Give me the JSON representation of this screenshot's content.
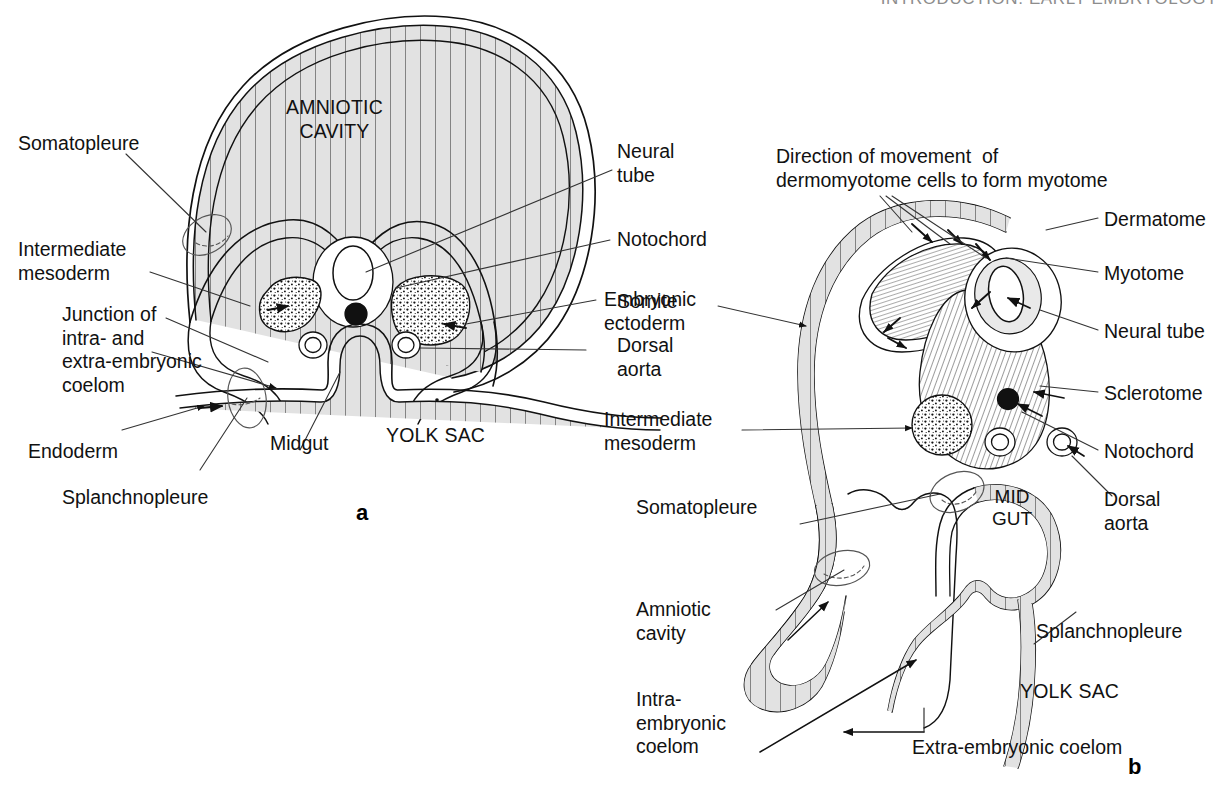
{
  "running_head": "INTRODUCTION: EARLY EMBRYOLOGY",
  "figure": {
    "type": "anatomical-diagram",
    "panels": [
      {
        "id": "a",
        "letter": "a",
        "caption_letter": "a",
        "internal_labels": [
          {
            "name": "amniotic-cavity",
            "text": "AMNIOTIC\nCAVITY"
          },
          {
            "name": "yolk-sac",
            "text": "YOLK SAC"
          }
        ],
        "leader_labels": [
          {
            "name": "somatopleure",
            "text": "Somatopleure"
          },
          {
            "name": "intermediate-mesoderm",
            "text": "Intermediate\nmesoderm"
          },
          {
            "name": "junction-coelom",
            "text": "Junction of\nintra- and\nextra-embryonic\ncoelom"
          },
          {
            "name": "endoderm",
            "text": "Endoderm"
          },
          {
            "name": "splanchnopleure",
            "text": "Splanchnopleure"
          },
          {
            "name": "midgut",
            "text": "Midgut"
          },
          {
            "name": "neural-tube",
            "text": "Neural\ntube"
          },
          {
            "name": "notochord",
            "text": "Notochord"
          },
          {
            "name": "somite",
            "text": "Somite"
          },
          {
            "name": "dorsal-aorta",
            "text": "Dorsal\naorta"
          }
        ]
      },
      {
        "id": "b",
        "letter": "b",
        "caption_letter": "b",
        "internal_labels": [
          {
            "name": "mid-gut",
            "text": "MID\nGUT"
          },
          {
            "name": "yolk-sac",
            "text": "YOLK SAC"
          }
        ],
        "leader_labels": [
          {
            "name": "direction-of-movement",
            "text": "Direction of movement  of\ndermomyotome cells to form myotome"
          },
          {
            "name": "embryonic-ectoderm",
            "text": "Embryonic\nectoderm"
          },
          {
            "name": "intermediate-mesoderm",
            "text": "Intermediate\nmesoderm"
          },
          {
            "name": "somatopleure",
            "text": "Somatopleure"
          },
          {
            "name": "amniotic-cavity",
            "text": "Amniotic\ncavity"
          },
          {
            "name": "intra-embryonic-coelom",
            "text": "Intra-\nembryonic\ncoelom"
          },
          {
            "name": "extra-embryonic-coelom",
            "text": "Extra-embryonic coelom"
          },
          {
            "name": "splanchnopleure",
            "text": "Splanchnopleure"
          },
          {
            "name": "dermatome",
            "text": "Dermatome"
          },
          {
            "name": "myotome",
            "text": "Myotome"
          },
          {
            "name": "neural-tube",
            "text": "Neural tube"
          },
          {
            "name": "sclerotome",
            "text": "Sclerotome"
          },
          {
            "name": "notochord",
            "text": "Notochord"
          },
          {
            "name": "dorsal-aorta",
            "text": "Dorsal\naorta"
          }
        ]
      }
    ]
  },
  "colors": {
    "ink": "#111111",
    "membrane_fill": "#e2e2e2",
    "running_head": "#8d8d8d",
    "page_background": "#ffffff"
  }
}
